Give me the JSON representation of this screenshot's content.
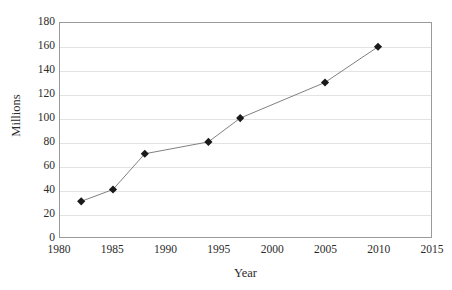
{
  "chart_data": {
    "type": "line",
    "title": "",
    "xlabel": "Year",
    "ylabel": "Millions",
    "xlim": [
      1980,
      2015
    ],
    "ylim": [
      0,
      180
    ],
    "grid": "horizontal",
    "legend": "none",
    "marker": "diamond",
    "series": [
      {
        "name": "",
        "x": [
          1982,
          1985,
          1988,
          1994,
          1997,
          2005,
          2010
        ],
        "values": [
          30,
          40,
          70,
          80,
          100,
          130,
          160
        ],
        "points": [
          {
            "x": 1982,
            "y": 30
          },
          {
            "x": 1985,
            "y": 40
          },
          {
            "x": 1988,
            "y": 70
          },
          {
            "x": 1994,
            "y": 80
          },
          {
            "x": 1997,
            "y": 100
          },
          {
            "x": 2005,
            "y": 130
          },
          {
            "x": 2010,
            "y": 160
          }
        ]
      }
    ],
    "x_ticks": [
      1980,
      1985,
      1990,
      1995,
      2000,
      2005,
      2010,
      2015
    ],
    "y_ticks": [
      0,
      20,
      40,
      60,
      80,
      100,
      120,
      140,
      160,
      180
    ],
    "x_tick_labels": [
      "1980",
      "1985",
      "1990",
      "1995",
      "2000",
      "2005",
      "2010",
      "2015"
    ],
    "y_tick_labels": [
      "0",
      "20",
      "40",
      "60",
      "80",
      "100",
      "120",
      "140",
      "160",
      "180"
    ],
    "colors": {
      "line": "#808080",
      "marker": "#1a1a1a",
      "gridline": "#e3e3e3",
      "axis": "#9a9a9a",
      "text": "#2b2b2b",
      "background": "#ffffff"
    }
  },
  "axis_titles": {
    "x": "Year",
    "y": "Millions"
  },
  "clipped_header": ""
}
